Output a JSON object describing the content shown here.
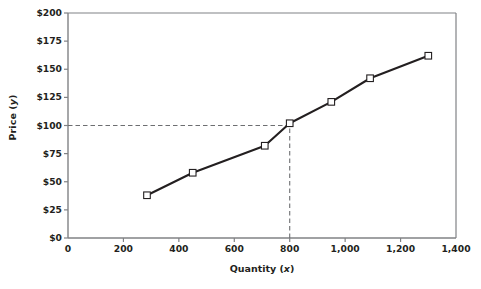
{
  "chart_data": {
    "type": "line",
    "title": "",
    "xlabel": "Quantity (x)",
    "ylabel": "Price (y)",
    "xlim": [
      0,
      1400
    ],
    "ylim": [
      0,
      200
    ],
    "grid": false,
    "legend": null,
    "x_ticks": [
      "0",
      "200",
      "400",
      "600",
      "800",
      "1,000",
      "1,200",
      "1,400"
    ],
    "x_tick_values": [
      0,
      200,
      400,
      600,
      800,
      1000,
      1200,
      1400
    ],
    "y_ticks": [
      "$0",
      "$25",
      "$50",
      "$75",
      "$100",
      "$125",
      "$150",
      "$175",
      "$200"
    ],
    "y_tick_values": [
      0,
      25,
      50,
      75,
      100,
      125,
      150,
      175,
      200
    ],
    "marker": "open-square",
    "series": [
      {
        "name": "Price vs Quantity",
        "x": [
          285,
          450,
          710,
          800,
          950,
          1090,
          1300
        ],
        "y": [
          38,
          58,
          82,
          102,
          121,
          142,
          162
        ]
      }
    ],
    "annotations": [
      {
        "name": "guide-line-horizontal",
        "style": "dashed",
        "axis": "y",
        "value": 100,
        "from_x": 0,
        "to_x": 800
      },
      {
        "name": "guide-line-vertical",
        "style": "dashed",
        "axis": "x",
        "value": 800,
        "from_y": 0,
        "to_y": 102
      }
    ]
  },
  "axis_titles": {
    "y_prefix": "Price (",
    "y_italic": "y",
    "y_suffix": ")",
    "x_prefix": "Quantity (",
    "x_italic": "x",
    "x_suffix": ")"
  },
  "footer": {
    "note": ""
  }
}
